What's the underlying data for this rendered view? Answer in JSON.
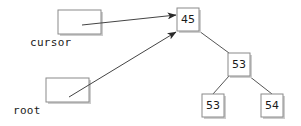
{
  "canvas": {
    "width": 301,
    "height": 126,
    "background": "#ffffff"
  },
  "style": {
    "box_fill": "#ffffff",
    "box_stroke": "#8a8a8a",
    "shadow": "#c8c8c8",
    "edge_stroke": "#555555",
    "arrow_stroke": "#444444",
    "text_color": "#1a1a1a"
  },
  "pointers": [
    {
      "id": "cursor",
      "label": "cursor",
      "box": {
        "x": 58,
        "y": 10,
        "w": 43,
        "h": 24
      },
      "label_pos": {
        "x": 30,
        "y": 37
      },
      "arrow": {
        "x1": 82,
        "y1": 25,
        "x2": 176,
        "y2": 15
      },
      "target": "node-45"
    },
    {
      "id": "root",
      "label": "root",
      "box": {
        "x": 46,
        "y": 78,
        "w": 43,
        "h": 24
      },
      "label_pos": {
        "x": 13,
        "y": 105
      },
      "arrow": {
        "x1": 69,
        "y1": 97,
        "x2": 176,
        "y2": 32
      },
      "target": "node-45"
    }
  ],
  "tree": {
    "nodes": [
      {
        "id": "node-45",
        "value": "45",
        "x": 177,
        "y": 8,
        "w": 22,
        "h": 23
      },
      {
        "id": "node-53-inner",
        "value": "53",
        "x": 228,
        "y": 53,
        "w": 22,
        "h": 23
      },
      {
        "id": "node-53-leaf",
        "value": "53",
        "x": 202,
        "y": 94,
        "w": 22,
        "h": 23
      },
      {
        "id": "node-54-leaf",
        "value": "54",
        "x": 261,
        "y": 94,
        "w": 22,
        "h": 23
      }
    ],
    "edges": [
      {
        "from": "node-45",
        "to": "node-53-inner",
        "x1": 199,
        "y1": 31,
        "x2": 229,
        "y2": 53
      },
      {
        "from": "node-53-inner",
        "to": "node-53-leaf",
        "x1": 229,
        "y1": 76,
        "x2": 213,
        "y2": 94
      },
      {
        "from": "node-53-inner",
        "to": "node-54-leaf",
        "x1": 249,
        "y1": 76,
        "x2": 272,
        "y2": 94
      }
    ]
  }
}
